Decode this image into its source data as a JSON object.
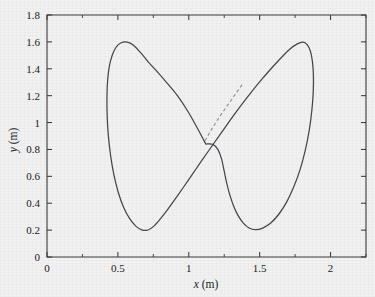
{
  "figure": {
    "background_color": "#f1f1f1",
    "axis_color": "#3a3a3a",
    "curve_color": "#44474c",
    "dashed_color": "#8e9196"
  },
  "chart_data": {
    "type": "line",
    "title": "",
    "subtitle": "",
    "xlabel_var": "x",
    "xlabel_unit": "(m)",
    "ylabel_var": "y",
    "ylabel_unit": "(m)",
    "xlabel": "x (m)",
    "ylabel": "y (m)",
    "xlim": [
      0,
      2.25
    ],
    "ylim": [
      0,
      1.8
    ],
    "xticks": [
      0,
      0.5,
      1,
      1.5,
      2
    ],
    "xtick_labels": [
      "0",
      "0.5",
      "1",
      "1.5",
      "2"
    ],
    "xticks_minor": [
      0.25,
      0.75,
      1.25,
      1.75,
      2.25
    ],
    "yticks": [
      0,
      0.2,
      0.4,
      0.6,
      0.8,
      1,
      1.2,
      1.4,
      1.6,
      1.8
    ],
    "ytick_labels": [
      "0",
      "0.2",
      "0.4",
      "0.6",
      "0.8",
      "1",
      "1.2",
      "1.4",
      "1.6",
      "1.8"
    ],
    "grid": false,
    "legend": null,
    "legend_position": "none",
    "series": [
      {
        "name": "trajectory",
        "style": "solid",
        "color": "#44474c",
        "description": "closed figure-eight (lemniscate-like) trajectory",
        "points": [
          [
            1.12,
            0.84
          ],
          [
            1.06,
            0.96
          ],
          [
            0.99,
            1.09
          ],
          [
            0.92,
            1.2
          ],
          [
            0.85,
            1.29
          ],
          [
            0.78,
            1.375
          ],
          [
            0.715,
            1.45
          ],
          [
            0.66,
            1.52
          ],
          [
            0.61,
            1.575
          ],
          [
            0.565,
            1.598
          ],
          [
            0.52,
            1.592
          ],
          [
            0.487,
            1.56
          ],
          [
            0.46,
            1.5
          ],
          [
            0.44,
            1.42
          ],
          [
            0.428,
            1.32
          ],
          [
            0.423,
            1.2
          ],
          [
            0.424,
            1.06
          ],
          [
            0.432,
            0.91
          ],
          [
            0.448,
            0.76
          ],
          [
            0.472,
            0.61
          ],
          [
            0.503,
            0.48
          ],
          [
            0.54,
            0.37
          ],
          [
            0.583,
            0.285
          ],
          [
            0.628,
            0.228
          ],
          [
            0.672,
            0.2
          ],
          [
            0.712,
            0.201
          ],
          [
            0.752,
            0.228
          ],
          [
            0.795,
            0.278
          ],
          [
            0.845,
            0.345
          ],
          [
            0.9,
            0.425
          ],
          [
            0.96,
            0.515
          ],
          [
            1.025,
            0.615
          ],
          [
            1.09,
            0.715
          ],
          [
            1.16,
            0.82
          ],
          [
            1.23,
            0.925
          ],
          [
            1.3,
            1.03
          ],
          [
            1.37,
            1.13
          ],
          [
            1.44,
            1.225
          ],
          [
            1.51,
            1.315
          ],
          [
            1.58,
            1.4
          ],
          [
            1.65,
            1.48
          ],
          [
            1.712,
            1.545
          ],
          [
            1.765,
            1.585
          ],
          [
            1.805,
            1.598
          ],
          [
            1.835,
            1.58
          ],
          [
            1.858,
            1.53
          ],
          [
            1.872,
            1.455
          ],
          [
            1.879,
            1.355
          ],
          [
            1.878,
            1.23
          ],
          [
            1.868,
            1.09
          ],
          [
            1.85,
            0.945
          ],
          [
            1.822,
            0.795
          ],
          [
            1.785,
            0.65
          ],
          [
            1.74,
            0.52
          ],
          [
            1.69,
            0.408
          ],
          [
            1.635,
            0.318
          ],
          [
            1.578,
            0.253
          ],
          [
            1.522,
            0.215
          ],
          [
            1.47,
            0.203
          ],
          [
            1.425,
            0.216
          ],
          [
            1.385,
            0.252
          ],
          [
            1.348,
            0.308
          ],
          [
            1.316,
            0.38
          ],
          [
            1.29,
            0.46
          ],
          [
            1.268,
            0.548
          ],
          [
            1.25,
            0.638
          ],
          [
            1.232,
            0.726
          ],
          [
            1.205,
            0.8
          ],
          [
            1.17,
            0.838
          ],
          [
            1.12,
            0.84
          ]
        ]
      },
      {
        "name": "predicted-path",
        "style": "dashed",
        "color": "#8e9196",
        "description": "short dashed segment branching upward-right from the crossing point",
        "points": [
          [
            1.115,
            0.865
          ],
          [
            1.155,
            0.94
          ],
          [
            1.2,
            1.015
          ],
          [
            1.248,
            1.09
          ],
          [
            1.295,
            1.16
          ],
          [
            1.34,
            1.228
          ],
          [
            1.382,
            1.29
          ]
        ]
      }
    ],
    "annotations": [
      {
        "name": "crossing-point",
        "x": 1.12,
        "y": 0.84,
        "label": ""
      }
    ]
  }
}
